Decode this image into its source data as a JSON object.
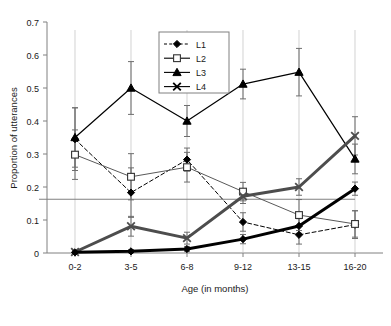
{
  "chart_data": {
    "type": "line",
    "title": "",
    "xlabel": "Age (in months)",
    "ylabel": "Proportion of utterances",
    "categories": [
      "0-2",
      "3-5",
      "6-8",
      "9-12",
      "13-15",
      "16-20"
    ],
    "ylim": [
      0,
      0.7
    ],
    "yticks": [
      "0",
      "0.1",
      "0.2",
      "0.3",
      "0.4",
      "0.5",
      "0.6",
      "0.7"
    ],
    "ytick_values": [
      0,
      0.1,
      0.2,
      0.3,
      0.4,
      0.5,
      0.6,
      0.7
    ],
    "grid": false,
    "legend_position": "top-center",
    "reference_line": {
      "value": 0.163,
      "color": "#808080",
      "label": ""
    },
    "series": [
      {
        "name": "L1",
        "marker": "filled-diamond",
        "line_style": "dashed",
        "line_width": 1,
        "color": "#000000",
        "values": [
          0.345,
          0.183,
          0.283,
          0.094,
          0.055,
          0.086
        ],
        "errors": [
          0.095,
          0.075,
          0.035,
          0.028,
          0.028,
          0.042
        ]
      },
      {
        "name": "L2",
        "marker": "open-square",
        "line_style": "solid",
        "line_width": 1,
        "color": "#595959",
        "values": [
          0.298,
          0.231,
          0.26,
          0.186,
          0.115,
          0.088
        ],
        "errors": [
          0.075,
          0.07,
          0.045,
          0.028,
          0.047,
          0.04
        ]
      },
      {
        "name": "L3",
        "marker": "filled-triangle",
        "line_style": "solid",
        "line_width": 1.2,
        "color": "#000000",
        "values": [
          0.35,
          0.5,
          0.4,
          0.512,
          0.548,
          0.285
        ],
        "errors": [
          0.09,
          0.08,
          0.047,
          0.045,
          0.072,
          0.045
        ]
      },
      {
        "name": "L4",
        "marker": "cross-x",
        "line_style": "solid",
        "line_width": 3,
        "color": "#4d4d4d",
        "values": [
          0.003,
          0.081,
          0.045,
          0.172,
          0.2,
          0.355
        ],
        "errors": [
          0.005,
          0.03,
          0.018,
          0.022,
          0.025,
          0.058
        ]
      },
      {
        "name": "L1-thick",
        "marker": "filled-diamond",
        "line_style": "solid",
        "line_width": 3,
        "color": "#000000",
        "values": [
          0.002,
          0.005,
          0.012,
          0.042,
          0.082,
          0.195
        ],
        "errors": [
          0.004,
          0.005,
          0.008,
          0.014,
          0.022,
          0.02
        ]
      }
    ],
    "legend_entries": [
      {
        "label": "L1",
        "marker": "filled-diamond",
        "line_style": "dashed"
      },
      {
        "label": "L2",
        "marker": "open-square",
        "line_style": "solid"
      },
      {
        "label": "L3",
        "marker": "filled-triangle",
        "line_style": "solid"
      },
      {
        "label": "L4",
        "marker": "cross-x",
        "line_style": "solid"
      }
    ]
  }
}
